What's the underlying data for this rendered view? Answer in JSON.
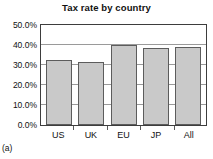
{
  "figure": {
    "caption": "(a)"
  },
  "chart_data": {
    "type": "bar",
    "title": "Tax rate by country",
    "xlabel": "",
    "ylabel": "",
    "categories": [
      "US",
      "UK",
      "EU",
      "JP",
      "All"
    ],
    "values": [
      32.5,
      31.5,
      40.0,
      38.5,
      39.0
    ],
    "value_unit": "%",
    "ylim": [
      0,
      50
    ],
    "ytick_values": [
      0,
      10,
      20,
      30,
      40,
      50
    ],
    "ytick_labels": [
      "0.0%",
      "10.0%",
      "20.0%",
      "30.0%",
      "40.0%",
      "50.0%"
    ],
    "grid": true,
    "grid_axis": "y",
    "legend": false,
    "legend_position": "none",
    "bar_fill_color": "#c9c9c9",
    "bar_border_color": "#5c5c5c",
    "axis_color": "#3d3d3d",
    "grid_color": "#9a9a9a",
    "background_color": "#ffffff"
  }
}
